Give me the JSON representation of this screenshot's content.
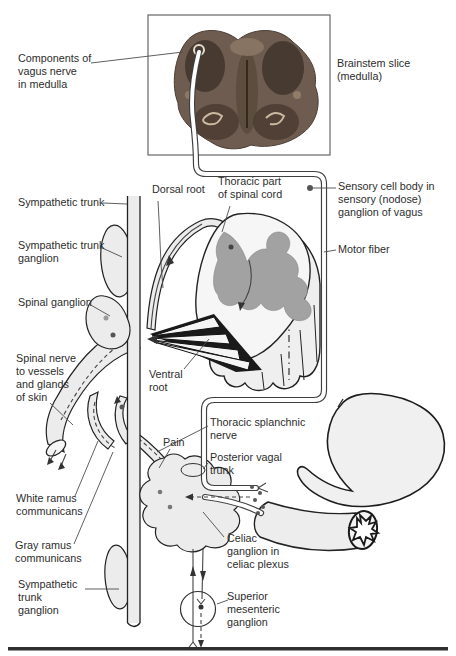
{
  "labels": {
    "components_of_vagus": "Components of\nvagus nerve\nin medulla",
    "brainstem_slice": "Brainstem slice\n(medulla)",
    "sympathetic_trunk": "Sympathetic trunk",
    "dorsal_root": "Dorsal root",
    "thoracic_part": "Thoracic part\nof spinal cord",
    "sensory_cell_body": "Sensory cell body in\nsensory (nodose)\nganglion of vagus",
    "motor_fiber": "Motor fiber",
    "sympathetic_trunk_ganglion": "Sympathetic trunk\nganglion",
    "spinal_ganglion": "Spinal ganglion",
    "spinal_nerve": "Spinal nerve\nto vessels\nand glands\nof skin",
    "ventral_root": "Ventral\nroot",
    "thoracic_splanchnic": "Thoracic splanchnic\nnerve",
    "pain": "Pain",
    "posterior_vagal": "Posterior vagal\ntrunk",
    "white_ramus": "White ramus\ncommunicans",
    "gray_ramus": "Gray ramus\ncommunicans",
    "sympathetic_trunk_ganglion_lower": "Sympathetic\ntrunk\nganglion",
    "celiac_ganglion": "Celiac\nganglion in\nceliac plexus",
    "superior_mesenteric": "Superior\nmesenteric\nganglion"
  },
  "colors": {
    "label": "#2d2d2d",
    "line": "#222222",
    "fill_light": "#ececec",
    "gray_matter": "#a2a2a2",
    "photo_brown": "#6e5c50"
  }
}
